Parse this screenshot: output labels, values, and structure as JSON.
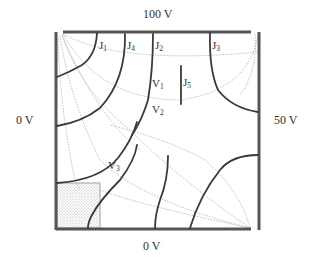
{
  "diagram": {
    "type": "potential field / equipotential map in square region",
    "boundaries": {
      "top": "100 V",
      "left": "0 V",
      "right": "50 V",
      "bottom": "0 V"
    },
    "labels": {
      "J1": {
        "main": "J",
        "sub": "1"
      },
      "J2": {
        "main": "J",
        "sub": "2"
      },
      "J3": {
        "main": "J",
        "sub": "3"
      },
      "J4": {
        "main": "J",
        "sub": "4"
      },
      "J5": {
        "main": "J",
        "sub": "5"
      },
      "V1": {
        "main": "V",
        "sub": "1"
      },
      "V2": {
        "main": "V",
        "sub": "2"
      },
      "V3": {
        "main": "V",
        "sub": "3"
      }
    },
    "regions": {
      "shaded_block": "dotted shaded rectangle at bottom-left corner"
    },
    "colors": {
      "frame": "#555555",
      "equipotential_lines": "#3a3a3a",
      "flux_lines": "#b8b8b8",
      "shading": "#9a9a9a"
    }
  }
}
